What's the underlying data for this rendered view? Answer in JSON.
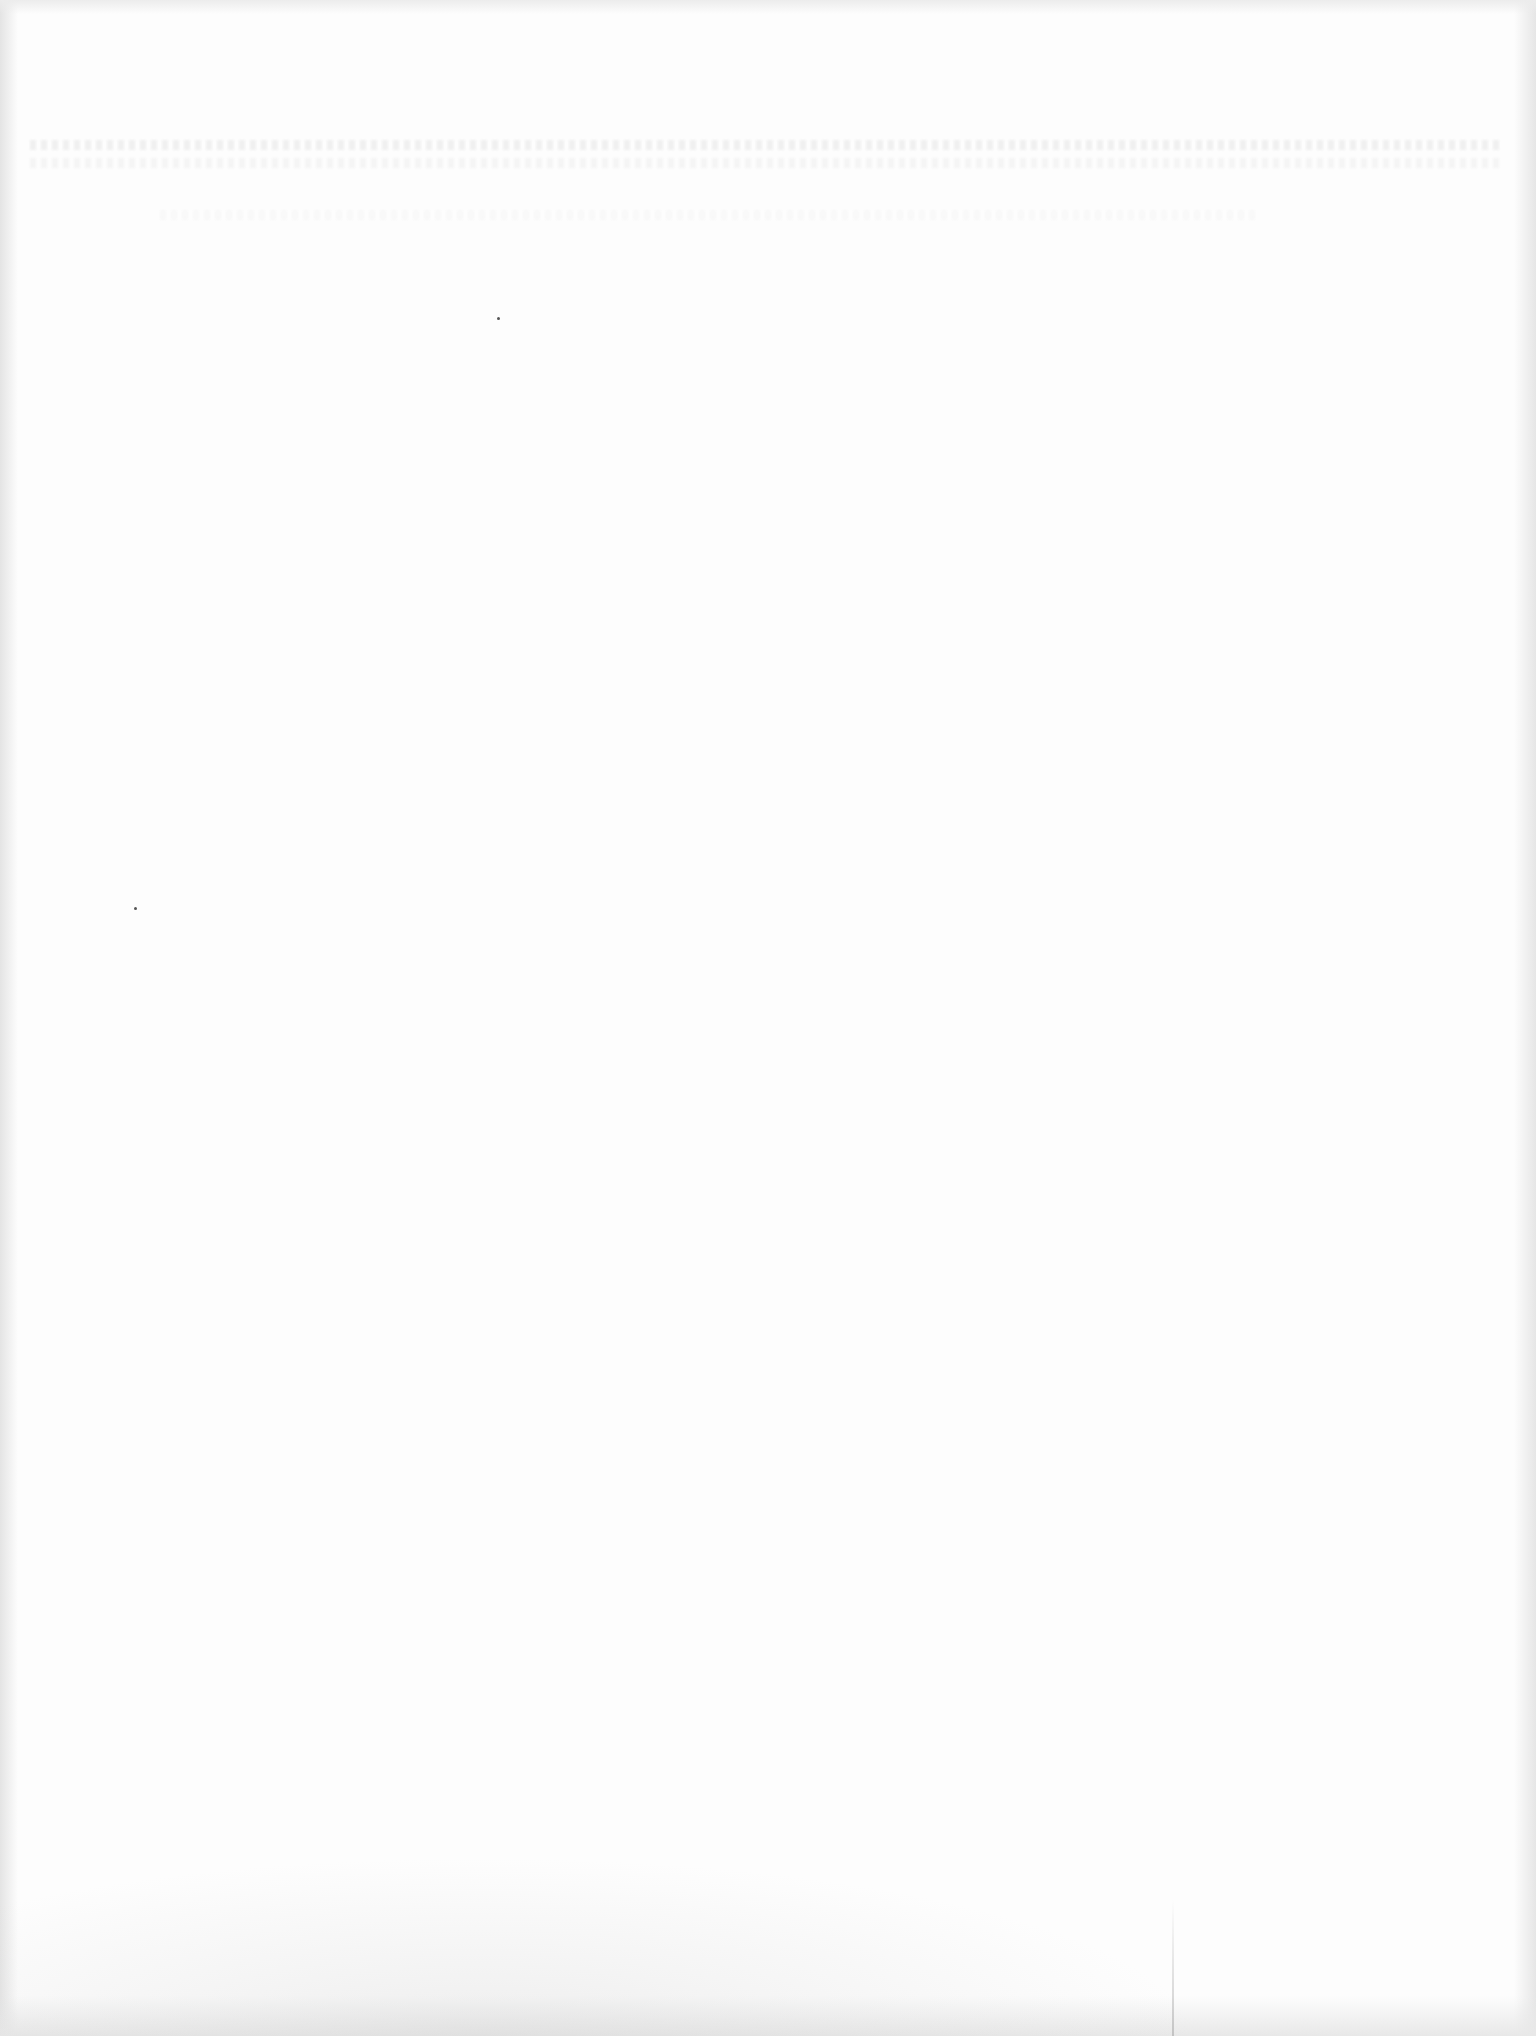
{
  "document": {
    "state": "blank",
    "text_content": [],
    "background_color": "#fdfdfd",
    "edge_shade_color": "#e4e4e4"
  },
  "artifacts": {
    "specks": [
      {
        "x": 498,
        "y": 318
      },
      {
        "x": 135,
        "y": 908
      }
    ]
  }
}
